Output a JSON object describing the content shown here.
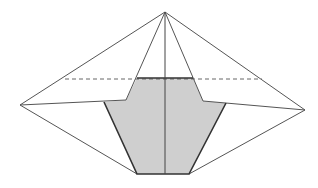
{
  "diagram": {
    "colors": {
      "background": "#ffffff",
      "line": "#555555",
      "shade_fill": "#cfcfcf",
      "shade_edge": "#333333",
      "dashed": "#666666"
    },
    "apex": [
      165,
      12
    ],
    "left_vertex": [
      20,
      105
    ],
    "right_vertex": [
      305,
      110
    ],
    "bottom_left": [
      137,
      174
    ],
    "bottom_right": [
      189,
      174
    ],
    "shaded_polygon": [
      [
        137,
        78
      ],
      [
        193,
        78
      ],
      [
        203,
        101
      ],
      [
        226,
        103
      ],
      [
        189,
        174
      ],
      [
        137,
        174
      ],
      [
        104,
        102
      ],
      [
        126,
        100
      ]
    ],
    "dashed_line": {
      "from": [
        65,
        79
      ],
      "to": [
        262,
        79
      ]
    },
    "center_line": {
      "from": [
        165,
        12
      ],
      "to": [
        165,
        174
      ]
    }
  }
}
